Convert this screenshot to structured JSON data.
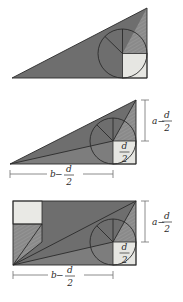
{
  "document": {
    "title": "Geometric proof figures: right triangle incircle and rectangle decomposition",
    "background_color": "#ffffff"
  },
  "palette": {
    "dark_gray": "#6e6e6e",
    "mid_gray": "#7d7d7d",
    "hatch_gray": "#8c8c8c",
    "light_square": "#e3e3e0",
    "pale_square": "#ebebe7",
    "outline": "#2a2a2a",
    "dimension_line": "#6f6f6f",
    "label_text": "#2a2a2a"
  },
  "figures": [
    {
      "id": "figure-top",
      "name": "right-triangle-with-incircle",
      "description": "Right triangle, right angle at lower right, with inscribed circle and a small light square at the right angle vertex.",
      "shapes": [
        "triangle",
        "incircle",
        "corner-square",
        "hatched-sector"
      ],
      "labels": []
    },
    {
      "id": "figure-middle",
      "name": "right-triangle-dissected-with-dimensions",
      "description": "Right triangle with incircle, corner square, internal chords, plus dimension callouts on right side and bottom.",
      "shapes": [
        "triangle",
        "incircle",
        "corner-square",
        "chords"
      ],
      "labels": [
        {
          "key": "right_dim",
          "lead": "a",
          "minus": "−",
          "numerator": "d",
          "denominator": "2",
          "text": "a − d/2",
          "position": "right"
        },
        {
          "key": "square_dim",
          "numerator": "d",
          "denominator": "2",
          "text": "d/2",
          "position": "inside-square"
        },
        {
          "key": "bottom_dim",
          "lead": "b",
          "minus": "−",
          "numerator": "d",
          "denominator": "2",
          "text": "b − d/2",
          "position": "bottom"
        }
      ]
    },
    {
      "id": "figure-bottom",
      "name": "rectangle-dissection-with-incircle",
      "description": "Rectangle containing the triangle dissection, an incircle with radial spokes, a pale square at upper left, a light square at lower right, and dimension callouts.",
      "shapes": [
        "rectangle",
        "incircle",
        "corner-square",
        "upper-left-square",
        "diagonals"
      ],
      "labels": [
        {
          "key": "right_dim",
          "lead": "a",
          "minus": "−",
          "numerator": "d",
          "denominator": "2",
          "text": "a − d/2",
          "position": "right"
        },
        {
          "key": "square_dim",
          "numerator": "d",
          "denominator": "2",
          "text": "d/2",
          "position": "inside-square"
        },
        {
          "key": "bottom_dim",
          "lead": "b",
          "minus": "−",
          "numerator": "d",
          "denominator": "2",
          "text": "b − d/2",
          "position": "bottom"
        }
      ]
    }
  ]
}
